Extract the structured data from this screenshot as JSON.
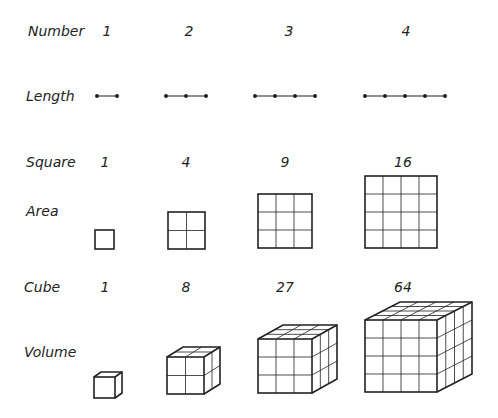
{
  "rows": {
    "number_label": "Number",
    "length_label": "Length",
    "square_label": "Square",
    "area_label": "Area",
    "cube_label": "Cube",
    "volume_label": "Volume"
  },
  "numbers": [
    "1",
    "2",
    "3",
    "4"
  ],
  "squares": [
    "1",
    "4",
    "9",
    "16"
  ],
  "cubes": [
    "1",
    "8",
    "27",
    "64"
  ],
  "colors": {
    "ink": "#222222",
    "background": "#ffffff"
  }
}
